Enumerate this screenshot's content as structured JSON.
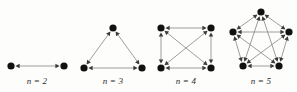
{
  "figure": {
    "background_color": "#fdfdfc",
    "node_color": "#111111",
    "edge_color": "#8c8c8c",
    "arrow_color": "#3b3b3b",
    "label_color": "#2a2a2a",
    "width": 297,
    "height": 92
  },
  "panels": [
    {
      "id": "k2",
      "label": "n = 2",
      "label_x": 37,
      "label_y": 76,
      "node_count": 2,
      "edge_count": 1,
      "node_radius": 3.6,
      "nodes": [
        {
          "id": "a",
          "x": 11,
          "y": 66
        },
        {
          "id": "b",
          "x": 64,
          "y": 66
        }
      ],
      "edges": [
        {
          "from": "a",
          "to": "b",
          "bidirectional": true
        }
      ]
    },
    {
      "id": "k3",
      "label": "n = 3",
      "label_x": 113,
      "label_y": 76,
      "node_count": 3,
      "edge_count": 3,
      "node_radius": 3.6,
      "nodes": [
        {
          "id": "t",
          "x": 113,
          "y": 28
        },
        {
          "id": "bl",
          "x": 84,
          "y": 68
        },
        {
          "id": "br",
          "x": 142,
          "y": 68
        }
      ],
      "edges": [
        {
          "from": "t",
          "to": "bl",
          "bidirectional": true
        },
        {
          "from": "t",
          "to": "br",
          "bidirectional": true
        },
        {
          "from": "bl",
          "to": "br",
          "bidirectional": true
        }
      ]
    },
    {
      "id": "k4",
      "label": "n = 4",
      "label_x": 186,
      "label_y": 76,
      "node_count": 4,
      "edge_count": 6,
      "node_radius": 3.6,
      "nodes": [
        {
          "id": "tl",
          "x": 161,
          "y": 28
        },
        {
          "id": "tr",
          "x": 211,
          "y": 28
        },
        {
          "id": "bl",
          "x": 161,
          "y": 68
        },
        {
          "id": "br",
          "x": 211,
          "y": 68
        }
      ],
      "edges": [
        {
          "from": "tl",
          "to": "tr",
          "bidirectional": true
        },
        {
          "from": "bl",
          "to": "br",
          "bidirectional": true
        },
        {
          "from": "tl",
          "to": "bl",
          "bidirectional": true
        },
        {
          "from": "tr",
          "to": "br",
          "bidirectional": true
        },
        {
          "from": "tl",
          "to": "br",
          "bidirectional": true
        },
        {
          "from": "tr",
          "to": "bl",
          "bidirectional": true
        }
      ]
    },
    {
      "id": "k5",
      "label": "n = 5",
      "label_x": 261,
      "label_y": 76,
      "node_count": 5,
      "edge_count": 10,
      "node_radius": 3.6,
      "nodes": [
        {
          "id": "v1",
          "x": 261,
          "y": 12
        },
        {
          "id": "v2",
          "x": 289,
          "y": 32
        },
        {
          "id": "v3",
          "x": 279,
          "y": 66
        },
        {
          "id": "v4",
          "x": 243,
          "y": 66
        },
        {
          "id": "v5",
          "x": 233,
          "y": 32
        }
      ],
      "edges": [
        {
          "from": "v1",
          "to": "v2",
          "bidirectional": true
        },
        {
          "from": "v2",
          "to": "v3",
          "bidirectional": true
        },
        {
          "from": "v3",
          "to": "v4",
          "bidirectional": true
        },
        {
          "from": "v4",
          "to": "v5",
          "bidirectional": true
        },
        {
          "from": "v5",
          "to": "v1",
          "bidirectional": true
        },
        {
          "from": "v1",
          "to": "v3",
          "bidirectional": true
        },
        {
          "from": "v1",
          "to": "v4",
          "bidirectional": true
        },
        {
          "from": "v2",
          "to": "v4",
          "bidirectional": true
        },
        {
          "from": "v2",
          "to": "v5",
          "bidirectional": true
        },
        {
          "from": "v3",
          "to": "v5",
          "bidirectional": true
        }
      ]
    }
  ]
}
